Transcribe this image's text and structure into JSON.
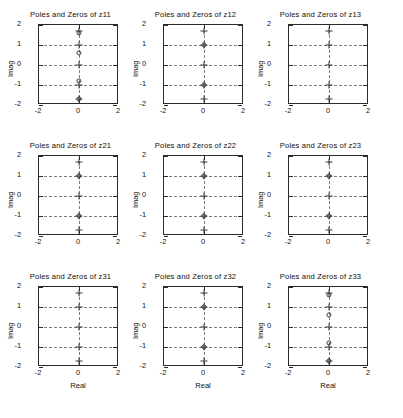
{
  "figure": {
    "rows": 3,
    "cols": 3,
    "background": "#ffffff",
    "axis_color": "#2b2b2b",
    "grid_color": "#7d7d7d",
    "marker_color": "#3b3b3b"
  },
  "axis": {
    "xlabel": "Real",
    "ylabel": "Imag",
    "xlim": [
      -2,
      2
    ],
    "ylim": [
      -2,
      2
    ],
    "xticks": [
      -2,
      0,
      2
    ],
    "xticklabels": [
      "-2",
      "0",
      "2"
    ],
    "yticks": [
      -2,
      -1,
      0,
      1,
      2
    ],
    "yticklabels": [
      "-2",
      "-1",
      "0",
      "1",
      "2"
    ],
    "grid": true,
    "grid_style": "dashed"
  },
  "legend": {
    "zero_marker": "circle",
    "pole_marker": "plus"
  },
  "chart_data": [
    {
      "type": "scatter",
      "title": "Poles and Zeros of z11",
      "xlabel": "Real",
      "ylabel": "Imag",
      "xlim": [
        -2,
        2
      ],
      "ylim": [
        -2,
        2
      ],
      "grid": true,
      "series": [
        {
          "name": "zeros",
          "marker": "circle",
          "x": [
            0,
            0,
            0,
            0
          ],
          "y": [
            1.62,
            0.6,
            -0.78,
            -1.68
          ]
        },
        {
          "name": "poles",
          "marker": "plus",
          "x": [
            0,
            0,
            0,
            0,
            0
          ],
          "y": [
            1.72,
            1.0,
            0.0,
            -1.0,
            -1.7
          ]
        }
      ]
    },
    {
      "type": "scatter",
      "title": "Poles and Zeros of z12",
      "xlabel": "Real",
      "ylabel": "Imag",
      "xlim": [
        -2,
        2
      ],
      "ylim": [
        -2,
        2
      ],
      "grid": true,
      "series": [
        {
          "name": "zeros",
          "marker": "circle",
          "x": [
            0,
            0
          ],
          "y": [
            1.0,
            -1.0
          ]
        },
        {
          "name": "poles",
          "marker": "plus",
          "x": [
            0,
            0,
            0,
            0,
            0
          ],
          "y": [
            1.72,
            1.0,
            0.0,
            -1.0,
            -1.72
          ]
        }
      ]
    },
    {
      "type": "scatter",
      "title": "Poles and Zeros of z13",
      "xlabel": "Real",
      "ylabel": "Imag",
      "xlim": [
        -2,
        2
      ],
      "ylim": [
        -2,
        2
      ],
      "grid": true,
      "series": [
        {
          "name": "zeros",
          "marker": "circle",
          "x": [],
          "y": []
        },
        {
          "name": "poles",
          "marker": "plus",
          "x": [
            0,
            0,
            0,
            0,
            0
          ],
          "y": [
            1.72,
            1.0,
            0.0,
            -1.0,
            -1.72
          ]
        }
      ]
    },
    {
      "type": "scatter",
      "title": "Poles and Zeros of z21",
      "xlabel": "Real",
      "ylabel": "Imag",
      "xlim": [
        -2,
        2
      ],
      "ylim": [
        -2,
        2
      ],
      "grid": true,
      "series": [
        {
          "name": "zeros",
          "marker": "circle",
          "x": [
            0,
            0
          ],
          "y": [
            1.0,
            -1.0
          ]
        },
        {
          "name": "poles",
          "marker": "plus",
          "x": [
            0,
            0,
            0,
            0,
            0
          ],
          "y": [
            1.72,
            1.0,
            0.0,
            -1.0,
            -1.72
          ]
        }
      ]
    },
    {
      "type": "scatter",
      "title": "Poles and Zeros of z22",
      "xlabel": "Real",
      "ylabel": "Imag",
      "xlim": [
        -2,
        2
      ],
      "ylim": [
        -2,
        2
      ],
      "grid": true,
      "series": [
        {
          "name": "zeros",
          "marker": "circle",
          "x": [
            0,
            0
          ],
          "y": [
            1.0,
            -1.0
          ]
        },
        {
          "name": "poles",
          "marker": "plus",
          "x": [
            0,
            0,
            0,
            0,
            0
          ],
          "y": [
            1.72,
            1.0,
            0.0,
            -1.0,
            -1.72
          ]
        }
      ]
    },
    {
      "type": "scatter",
      "title": "Poles and Zeros of z23",
      "xlabel": "Real",
      "ylabel": "Imag",
      "xlim": [
        -2,
        2
      ],
      "ylim": [
        -2,
        2
      ],
      "grid": true,
      "series": [
        {
          "name": "zeros",
          "marker": "circle",
          "x": [
            0,
            0
          ],
          "y": [
            1.0,
            -1.0
          ]
        },
        {
          "name": "poles",
          "marker": "plus",
          "x": [
            0,
            0,
            0,
            0,
            0
          ],
          "y": [
            1.72,
            1.0,
            0.0,
            -1.0,
            -1.72
          ]
        }
      ]
    },
    {
      "type": "scatter",
      "title": "Poles and Zeros of z31",
      "xlabel": "Real",
      "ylabel": "Imag",
      "xlim": [
        -2,
        2
      ],
      "ylim": [
        -2,
        2
      ],
      "grid": true,
      "series": [
        {
          "name": "zeros",
          "marker": "circle",
          "x": [],
          "y": []
        },
        {
          "name": "poles",
          "marker": "plus",
          "x": [
            0,
            0,
            0,
            0,
            0
          ],
          "y": [
            1.72,
            1.0,
            0.0,
            -1.0,
            -1.72
          ]
        }
      ]
    },
    {
      "type": "scatter",
      "title": "Poles and Zeros of z32",
      "xlabel": "Real",
      "ylabel": "Imag",
      "xlim": [
        -2,
        2
      ],
      "ylim": [
        -2,
        2
      ],
      "grid": true,
      "series": [
        {
          "name": "zeros",
          "marker": "circle",
          "x": [
            0,
            0
          ],
          "y": [
            1.0,
            -1.0
          ]
        },
        {
          "name": "poles",
          "marker": "plus",
          "x": [
            0,
            0,
            0,
            0,
            0
          ],
          "y": [
            1.72,
            1.0,
            0.0,
            -1.0,
            -1.72
          ]
        }
      ]
    },
    {
      "type": "scatter",
      "title": "Poles and Zeros of z33",
      "xlabel": "Real",
      "ylabel": "Imag",
      "xlim": [
        -2,
        2
      ],
      "ylim": [
        -2,
        2
      ],
      "grid": true,
      "series": [
        {
          "name": "zeros",
          "marker": "circle",
          "x": [
            0,
            0,
            0,
            0
          ],
          "y": [
            1.62,
            0.6,
            -0.78,
            -1.68
          ]
        },
        {
          "name": "poles",
          "marker": "plus",
          "x": [
            0,
            0,
            0,
            0,
            0
          ],
          "y": [
            1.72,
            1.0,
            0.0,
            -1.0,
            -1.7
          ]
        }
      ]
    }
  ]
}
